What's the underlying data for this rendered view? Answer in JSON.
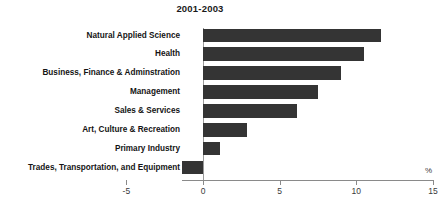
{
  "chart": {
    "title": "2001-2003",
    "unit_label": "%"
  },
  "chart_data": {
    "type": "bar",
    "orientation": "horizontal",
    "title": "2001-2003",
    "xlabel": "%",
    "ylabel": "",
    "xlim": [
      -5,
      15
    ],
    "xticks": [
      -5,
      0,
      5,
      10,
      15
    ],
    "xtick_labels": [
      "-5",
      "0",
      "5",
      "10",
      "15"
    ],
    "grid": false,
    "legend": false,
    "bar_color": "#343434",
    "axis_color": "#8a8a8a",
    "categories": [
      "Natural Applied Science",
      "Health",
      "Business, Finance & Adminstration",
      "Management",
      "Sales & Services",
      "Art, Culture & Recreation",
      "Primary Industry",
      "Trades, Transportation, and Equipment"
    ],
    "values": [
      11.6,
      10.5,
      9.0,
      7.5,
      6.1,
      2.9,
      1.1,
      -1.4
    ]
  }
}
